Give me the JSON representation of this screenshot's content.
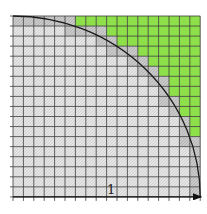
{
  "diagram": {
    "grid": {
      "rows": 18,
      "cols": 18,
      "origin_x": 13,
      "origin_y": 16,
      "cell_w": 10.4,
      "cell_h": 10.05
    },
    "green_start_col_by_row": [
      6,
      9,
      10,
      12,
      13,
      14,
      15,
      15,
      16,
      16,
      17,
      17,
      18,
      18,
      18,
      18,
      18,
      18
    ],
    "colors": {
      "outside_fill": "#8ee04a",
      "inside_fill": "#e2e2e2",
      "boundary_fill": "#c4c4c4",
      "grid_line": "#3a3a3a",
      "arc": "#1a1a1a",
      "background": "#ffffff"
    },
    "arc": {
      "radius_cells": 18,
      "center": "bottom-left"
    },
    "axis": {
      "label": "1",
      "arrow": "right-arrow"
    }
  }
}
